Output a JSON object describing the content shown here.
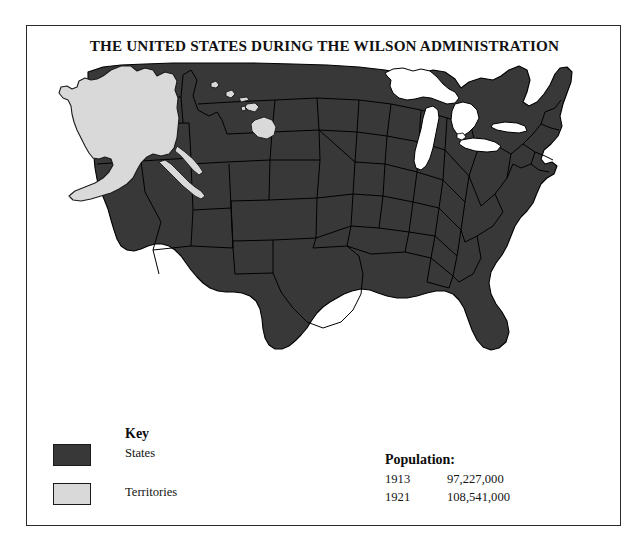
{
  "title": "THE UNITED STATES DURING THE WILSON ADMINISTRATION",
  "legend": {
    "heading": "Key",
    "items": [
      {
        "label": "States",
        "swatch": "#383838"
      },
      {
        "label": "Territories",
        "swatch": "#d9d9d9"
      }
    ]
  },
  "population": {
    "heading": "Population:",
    "rows": [
      {
        "year": "1913",
        "value": "97,227,000"
      },
      {
        "year": "1921",
        "value": "108,541,000"
      }
    ]
  },
  "map": {
    "states_fill": "#383838",
    "territories_fill": "#d9d9d9",
    "water_fill": "#ffffff",
    "outline": "#000000",
    "regions": [
      {
        "name": "contiguous-united-states",
        "class": "States"
      },
      {
        "name": "great-lakes",
        "class": "Water"
      },
      {
        "name": "alaska",
        "class": "Territories"
      },
      {
        "name": "hawaii",
        "class": "Territories"
      }
    ]
  },
  "frame": {
    "border_color": "#2b2b2b"
  }
}
